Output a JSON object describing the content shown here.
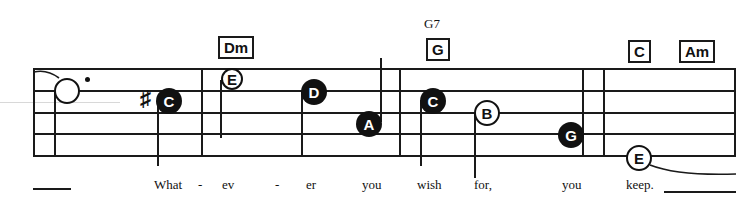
{
  "chords": [
    {
      "label": "Dm",
      "x": 218,
      "y": 36
    },
    {
      "label": "G",
      "x": 426,
      "y": 38
    },
    {
      "label": "C",
      "x": 628,
      "y": 40
    },
    {
      "label": "Am",
      "x": 679,
      "y": 40
    }
  ],
  "chord_alt": {
    "label": "G7",
    "x": 424,
    "y": 16
  },
  "notes": [
    {
      "name": "",
      "x": 55,
      "y": 79,
      "type": "hollow-whole"
    },
    {
      "name": "C",
      "x": 158,
      "y": 89,
      "type": "filled"
    },
    {
      "name": "E",
      "x": 221,
      "y": 68,
      "type": "hollow"
    },
    {
      "name": "D",
      "x": 303,
      "y": 80,
      "type": "filled"
    },
    {
      "name": "A",
      "x": 357,
      "y": 112,
      "type": "filled"
    },
    {
      "name": "C",
      "x": 420,
      "y": 89,
      "type": "filled"
    },
    {
      "name": "B",
      "x": 475,
      "y": 101,
      "type": "hollow"
    },
    {
      "name": "G",
      "x": 559,
      "y": 123,
      "type": "filled"
    },
    {
      "name": "E",
      "x": 627,
      "y": 146,
      "type": "hollow"
    }
  ],
  "lyrics": [
    {
      "text": "What",
      "x": 154
    },
    {
      "text": "-",
      "x": 198
    },
    {
      "text": "ev",
      "x": 222
    },
    {
      "text": "-",
      "x": 275
    },
    {
      "text": "er",
      "x": 306
    },
    {
      "text": "you",
      "x": 362
    },
    {
      "text": "wish",
      "x": 417
    },
    {
      "text": "for,",
      "x": 474
    },
    {
      "text": "you",
      "x": 562
    },
    {
      "text": "keep.",
      "x": 626
    }
  ],
  "accidental": {
    "symbol": "♯",
    "x": 140,
    "y": 86
  }
}
